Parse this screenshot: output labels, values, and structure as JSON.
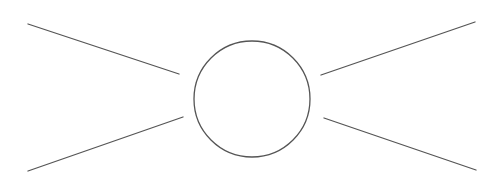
{
  "diagram": {
    "type": "node-with-rays",
    "canvas": {
      "width": 500,
      "height": 181,
      "background": "#ffffff"
    },
    "stroke_color": "#555555",
    "stroke_width": 1.3,
    "circle": {
      "cx": 252,
      "cy": 99,
      "r": 58
    },
    "lines": [
      {
        "name": "ray-top-left",
        "x1": 28,
        "y1": 24,
        "x2": 179,
        "y2": 74
      },
      {
        "name": "ray-bottom-left",
        "x1": 28,
        "y1": 171,
        "x2": 183,
        "y2": 117
      },
      {
        "name": "ray-top-right",
        "x1": 321,
        "y1": 75,
        "x2": 475,
        "y2": 22
      },
      {
        "name": "ray-bottom-right",
        "x1": 324,
        "y1": 118,
        "x2": 476,
        "y2": 170
      }
    ]
  }
}
